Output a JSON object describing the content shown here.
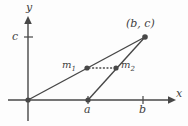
{
  "figure": {
    "background_color": "#fdfdfd",
    "stroke_color": "#474747",
    "axes": {
      "x_label": "x",
      "y_label": "y",
      "origin": {
        "x": 28,
        "y": 100
      }
    },
    "ticks": [
      {
        "name": "c",
        "label": "c",
        "axis": "y",
        "value_px": 37
      },
      {
        "name": "a",
        "label": "a",
        "axis": "x",
        "value_px": 88
      },
      {
        "name": "b",
        "label": "b",
        "axis": "x",
        "value_px": 143
      }
    ],
    "points": [
      {
        "name": "origin",
        "label": "",
        "x": 28,
        "y": 100
      },
      {
        "name": "a-point",
        "label": "",
        "x": 88,
        "y": 100
      },
      {
        "name": "vertex",
        "label": "(b, c)",
        "x": 145,
        "y": 37
      },
      {
        "name": "m1",
        "label": "m",
        "sub": "1",
        "x": 87,
        "y": 68
      },
      {
        "name": "m2",
        "label": "m",
        "sub": "2",
        "x": 116,
        "y": 68
      }
    ],
    "segments": [
      {
        "name": "origin-to-vertex",
        "style": "solid",
        "x1": 28,
        "y1": 100,
        "x2": 145,
        "y2": 37
      },
      {
        "name": "a-to-vertex",
        "style": "solid",
        "x1": 88,
        "y1": 100,
        "x2": 145,
        "y2": 37
      },
      {
        "name": "m1-to-m2",
        "style": "dotted",
        "x1": 88,
        "y1": 68,
        "x2": 115,
        "y2": 68
      }
    ]
  }
}
